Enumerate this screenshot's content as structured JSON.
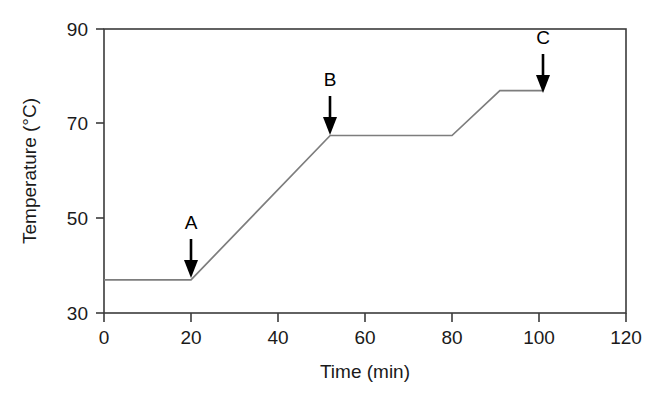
{
  "chart_data": {
    "type": "line",
    "title": "",
    "subtitle": "",
    "xlabel": "Time (min)",
    "ylabel": "Temperature (°C)",
    "xlim": [
      0,
      120
    ],
    "ylim": [
      30,
      90
    ],
    "xticks": [
      0,
      20,
      40,
      60,
      80,
      100,
      120
    ],
    "xtick_labels": [
      "0",
      "20",
      "40",
      "60",
      "80",
      "100",
      "120"
    ],
    "yticks": [
      30,
      50,
      70,
      90
    ],
    "ytick_labels": [
      "30",
      "50",
      "70",
      "90"
    ],
    "grid": false,
    "legend": false,
    "legend_position": "none",
    "frame": "box",
    "series": [
      {
        "name": "Temperature profile",
        "color": "#7d7d7d",
        "x": [
          0,
          20,
          52,
          80,
          91,
          101
        ],
        "y": [
          37,
          37,
          67.5,
          67.5,
          77,
          77
        ],
        "points": [
          {
            "x": 0,
            "y": 37,
            "note": "start, isothermal hold"
          },
          {
            "x": 20,
            "y": 37,
            "note": "end of initial hold (A)"
          },
          {
            "x": 52,
            "y": 67.5,
            "note": "end of first ramp (B)"
          },
          {
            "x": 80,
            "y": 67.5,
            "note": "end of plateau"
          },
          {
            "x": 91,
            "y": 77,
            "note": "end of second ramp"
          },
          {
            "x": 101,
            "y": 77,
            "note": "final point (C)"
          }
        ]
      }
    ],
    "annotations": [
      {
        "label": "A",
        "x": 20,
        "y": 37,
        "type": "down-arrow",
        "label_x": 20,
        "label_y": 49
      },
      {
        "label": "B",
        "x": 52,
        "y": 67.5,
        "type": "down-arrow",
        "label_x": 52,
        "label_y": 80
      },
      {
        "label": "C",
        "x": 101,
        "y": 77,
        "type": "down-arrow",
        "label_x": 101,
        "label_y": 89
      }
    ]
  },
  "axes": {
    "x_title": "Time (min)",
    "y_title": "Temperature (°C)",
    "x_ticks": [
      {
        "value": 0,
        "label": "0"
      },
      {
        "value": 20,
        "label": "20"
      },
      {
        "value": 40,
        "label": "40"
      },
      {
        "value": 60,
        "label": "60"
      },
      {
        "value": 80,
        "label": "80"
      },
      {
        "value": 100,
        "label": "100"
      },
      {
        "value": 120,
        "label": "120"
      }
    ],
    "y_ticks": [
      {
        "value": 30,
        "label": "30"
      },
      {
        "value": 50,
        "label": "50"
      },
      {
        "value": 70,
        "label": "70"
      },
      {
        "value": 90,
        "label": "90"
      }
    ]
  },
  "annotation_labels": {
    "a": "A",
    "b": "B",
    "c": "C"
  },
  "colors": {
    "line": "#7d7d7d",
    "frame": "#3b3b3b",
    "arrow": "#000000",
    "text": "#1a1a1a",
    "background": "#ffffff"
  }
}
